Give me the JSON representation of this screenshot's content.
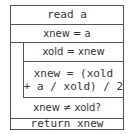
{
  "diagram": {
    "type": "nassi-shneiderman",
    "blocks": [
      {
        "id": "read",
        "text": "read a"
      },
      {
        "id": "init",
        "text": "xnew = a"
      },
      {
        "id": "loop",
        "kind": "do-while",
        "body": [
          {
            "id": "save",
            "text": "xold = xnew"
          },
          {
            "id": "update",
            "text": "xnew = (xold\n+ a / xold) / 2"
          }
        ],
        "condition": "xnew ≠ xold?"
      },
      {
        "id": "return",
        "text": "return xnew"
      }
    ]
  }
}
